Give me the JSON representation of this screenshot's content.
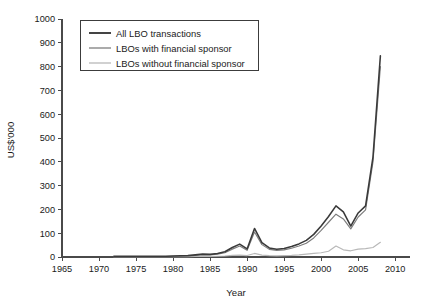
{
  "chart_data": {
    "type": "line",
    "title": "",
    "xlabel": "Year",
    "ylabel": "US$'000",
    "xlim": [
      1965,
      2012
    ],
    "ylim": [
      0,
      1000
    ],
    "grid": false,
    "legend_position": "top-left",
    "xticks": [
      1965,
      1970,
      1975,
      1980,
      1985,
      1990,
      1995,
      2000,
      2005,
      2010
    ],
    "yticks": [
      0,
      100,
      200,
      300,
      400,
      500,
      600,
      700,
      800,
      900,
      1000
    ],
    "x": [
      1972,
      1973,
      1974,
      1975,
      1976,
      1977,
      1978,
      1979,
      1980,
      1981,
      1982,
      1983,
      1984,
      1985,
      1986,
      1987,
      1988,
      1989,
      1990,
      1991,
      1992,
      1993,
      1994,
      1995,
      1996,
      1997,
      1998,
      1999,
      2000,
      2001,
      2002,
      2003,
      2004,
      2005,
      2006,
      2007,
      2008
    ],
    "series": [
      {
        "name": "All LBO transactions",
        "color": "#3a3a3a",
        "values": [
          3,
          3,
          3,
          3,
          3,
          3,
          3,
          3,
          4,
          5,
          6,
          9,
          12,
          11,
          15,
          22,
          40,
          54,
          34,
          120,
          60,
          38,
          33,
          36,
          44,
          55,
          70,
          95,
          130,
          170,
          215,
          190,
          130,
          185,
          215,
          420,
          845
        ]
      },
      {
        "name": "LBOs with financial sponsor",
        "color": "#7d7d7d",
        "values": [
          2,
          2,
          2,
          2,
          2,
          2,
          2,
          2,
          3,
          4,
          5,
          7,
          10,
          9,
          12,
          18,
          33,
          46,
          28,
          105,
          52,
          32,
          28,
          30,
          37,
          46,
          58,
          80,
          112,
          146,
          180,
          160,
          118,
          168,
          198,
          400,
          800
        ]
      },
      {
        "name": "LBOs without financial sponsor",
        "color": "#b8b8b8",
        "values": [
          1,
          1,
          1,
          1,
          1,
          1,
          1,
          1,
          1,
          1,
          1,
          2,
          2,
          2,
          3,
          4,
          7,
          8,
          6,
          15,
          8,
          6,
          5,
          6,
          7,
          9,
          12,
          15,
          18,
          24,
          46,
          30,
          26,
          33,
          35,
          40,
          62
        ]
      }
    ]
  },
  "axes": {
    "y_axis_title": "US$'000",
    "x_axis_title": "Year"
  },
  "legend": {
    "entries": [
      {
        "label": "All LBO transactions",
        "color": "#3a3a3a"
      },
      {
        "label": "LBOs with financial sponsor",
        "color": "#7d7d7d"
      },
      {
        "label": "LBOs without financial sponsor",
        "color": "#b8b8b8"
      }
    ]
  }
}
